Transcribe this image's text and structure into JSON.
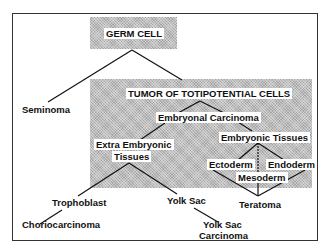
{
  "diagram": {
    "title_box": "GERM CELL",
    "tumor_box": "TUMOR OF TOTIPOTENTIAL CELLS",
    "nodes": {
      "seminoma": "Seminoma",
      "embryonal_carcinoma": "Embryonal Carcinoma",
      "extra_embryonic_1": "Extra Embryonic",
      "extra_embryonic_2": "Tissues",
      "embryonic_tissues": "Embryonic Tissues",
      "ectoderm": "Ectoderm",
      "endoderm": "Endoderm",
      "mesoderm": "Mesoderm",
      "trophoblast": "Trophoblast",
      "yolk_sac": "Yolk Sac",
      "teratoma": "Teratoma",
      "choriocarcinoma": "Choriocarcinoma",
      "yolk_sac_carcinoma_1": "Yolk Sac",
      "yolk_sac_carcinoma_2": "Carcinoma"
    },
    "edges": [
      [
        "GERM CELL",
        "Seminoma"
      ],
      [
        "GERM CELL",
        "TUMOR OF TOTIPOTENTIAL CELLS"
      ],
      [
        "TUMOR OF TOTIPOTENTIAL CELLS",
        "Embryonal Carcinoma"
      ],
      [
        "Embryonal Carcinoma",
        "Extra Embryonic Tissues"
      ],
      [
        "Embryonal Carcinoma",
        "Embryonic Tissues"
      ],
      [
        "Embryonic Tissues",
        "Ectoderm"
      ],
      [
        "Embryonic Tissues",
        "Mesoderm"
      ],
      [
        "Embryonic Tissues",
        "Endoderm"
      ],
      [
        "Ectoderm",
        "Teratoma"
      ],
      [
        "Mesoderm",
        "Teratoma"
      ],
      [
        "Endoderm",
        "Teratoma"
      ],
      [
        "Extra Embryonic Tissues",
        "Trophoblast"
      ],
      [
        "Extra Embryonic Tissues",
        "Yolk Sac"
      ],
      [
        "Trophoblast",
        "Choriocarcinoma"
      ],
      [
        "Yolk Sac",
        "Yolk Sac Carcinoma"
      ]
    ]
  }
}
